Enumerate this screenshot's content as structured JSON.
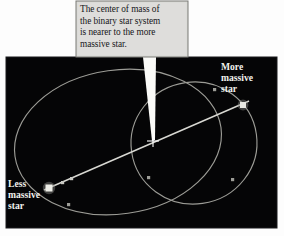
{
  "figure": {
    "kind": "astronomy-diagram",
    "background_color": "#fdfdfd",
    "panel_color": "#050506",
    "orbit_color": "#9c9c96",
    "axis_color": "#d8d8d2",
    "star_color": "#e8e8e2",
    "callout_fill": "#d8d8d4",
    "callout_border": "#7a7a76",
    "pointer_color": "#fbfbf8",
    "label_color": "#f2f2ee",
    "callout_text_color": "#16161a"
  },
  "callout": {
    "text": "The center of mass of the binary star system is nearer to the more massive star.",
    "lines": [
      "The center of mass of",
      "the binary star system",
      "is nearer to the more",
      "massive star."
    ]
  },
  "labels": {
    "more_massive": "More massive star",
    "more_massive_lines": [
      "More",
      "massive",
      "star"
    ],
    "less_massive": "Less massive star",
    "less_massive_lines": [
      "Less",
      "massive",
      "star"
    ]
  },
  "markers": {
    "center_of_mass": "center-of-mass-cross",
    "more_massive_star": "more-massive-star-dot",
    "less_massive_star": "less-massive-star-dot"
  }
}
